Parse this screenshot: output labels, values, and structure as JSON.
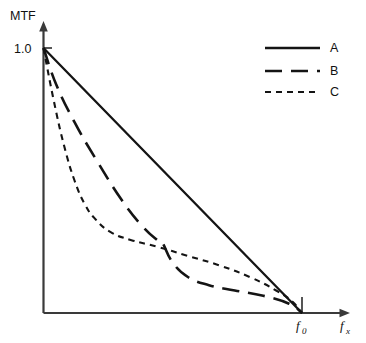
{
  "chart_data": {
    "type": "line",
    "title": "",
    "subtitle": "",
    "xlabel": "f_x",
    "ylabel": "MTF",
    "xlabel_base": "f",
    "xlabel_sub": "x",
    "grid": false,
    "legend_position": "top-right",
    "xlim": [
      0,
      1.15
    ],
    "ylim": [
      0,
      1.12
    ],
    "x_ticks": [
      {
        "value": 1.0,
        "label_base": "f",
        "label_sub": "0",
        "label": "f0"
      }
    ],
    "y_ticks": [
      {
        "value": 1.0,
        "label": "1.0"
      }
    ],
    "annotations": [],
    "series": [
      {
        "name": "A",
        "label": "A",
        "style": "solid",
        "description": "straight linear decline from MTF 1.0 at f=0 to 0 at f0",
        "x": [
          0.0,
          0.1,
          0.2,
          0.3,
          0.4,
          0.5,
          0.6,
          0.7,
          0.8,
          0.9,
          1.0
        ],
        "y": [
          1.0,
          0.9,
          0.8,
          0.7,
          0.6,
          0.5,
          0.4,
          0.3,
          0.2,
          0.1,
          0.0
        ]
      },
      {
        "name": "B",
        "label": "B",
        "style": "long-dash",
        "description": "steep initial fall with a knee near 0.46 f0, then a low flat tail to 0 at f0",
        "x": [
          0.0,
          0.05,
          0.12,
          0.2,
          0.3,
          0.38,
          0.44,
          0.46,
          0.5,
          0.56,
          0.64,
          0.74,
          0.85,
          0.95,
          1.0
        ],
        "y": [
          1.0,
          0.86,
          0.72,
          0.585,
          0.43,
          0.33,
          0.275,
          0.265,
          0.19,
          0.135,
          0.105,
          0.085,
          0.065,
          0.035,
          0.0
        ]
      },
      {
        "name": "C",
        "label": "C",
        "style": "short-dash",
        "description": "very steep initial fall, bends near 0.18 f0, then a long gentle decline to 0 at f0",
        "x": [
          0.0,
          0.04,
          0.08,
          0.12,
          0.16,
          0.2,
          0.26,
          0.34,
          0.44,
          0.56,
          0.68,
          0.8,
          0.9,
          0.96,
          1.0
        ],
        "y": [
          1.0,
          0.8,
          0.63,
          0.5,
          0.41,
          0.355,
          0.305,
          0.275,
          0.25,
          0.215,
          0.18,
          0.135,
          0.085,
          0.045,
          0.0
        ]
      }
    ],
    "colors": {
      "curve": "#141414",
      "axis": "#3a3a3a",
      "text": "#111111",
      "background": "#ffffff"
    }
  },
  "legend": {
    "entries": [
      {
        "label": "A",
        "style": "solid"
      },
      {
        "label": "B",
        "style": "long-dash"
      },
      {
        "label": "C",
        "style": "short-dash"
      }
    ]
  },
  "axes": {
    "y_axis_label": "MTF",
    "y_tick_label": "1.0",
    "x_tick_label_base": "f",
    "x_tick_label_sub": "0",
    "x_axis_label_base": "f",
    "x_axis_label_sub": "x"
  }
}
